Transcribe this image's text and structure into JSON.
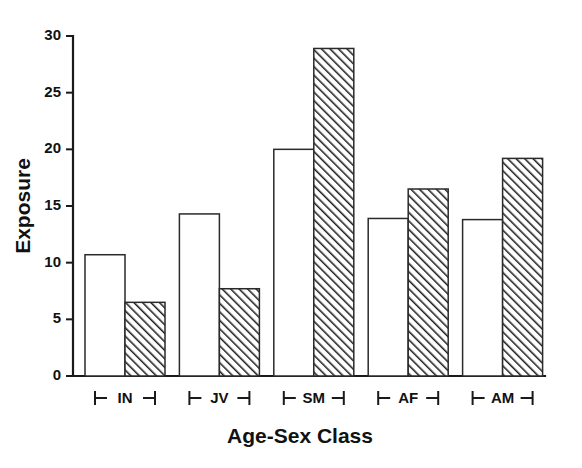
{
  "chart_data": {
    "type": "bar",
    "title": "",
    "xlabel": "Age-Sex Class",
    "ylabel": "Exposure",
    "categories": [
      "IN",
      "JV",
      "SM",
      "AF",
      "AM"
    ],
    "series": [
      {
        "name": "open",
        "fill": "white",
        "values": [
          10.7,
          14.3,
          20.0,
          13.9,
          13.8
        ]
      },
      {
        "name": "hatched",
        "fill": "diagonal-hatch",
        "values": [
          6.5,
          7.7,
          28.9,
          16.5,
          19.2
        ]
      }
    ],
    "ylim": [
      0,
      30
    ],
    "yticks": [
      0,
      5,
      10,
      15,
      20,
      25,
      30
    ],
    "ytick_labels": [
      "0",
      "5",
      "10",
      "15",
      "20",
      "25",
      "30"
    ],
    "grid": false,
    "legend": "none",
    "axis_color": "#1a1a1a",
    "bar_edge_color": "#2a2a2a",
    "background": "#ffffff"
  },
  "axis": {
    "y_title": "Exposure",
    "x_title": "Age-Sex Class"
  },
  "xticks": [
    {
      "label": "IN"
    },
    {
      "label": "JV"
    },
    {
      "label": "SM"
    },
    {
      "label": "AF"
    },
    {
      "label": "AM"
    }
  ],
  "yticks": [
    {
      "label": "30"
    },
    {
      "label": "25"
    },
    {
      "label": "20"
    },
    {
      "label": "15"
    },
    {
      "label": "10"
    },
    {
      "label": "5"
    },
    {
      "label": "0"
    }
  ]
}
